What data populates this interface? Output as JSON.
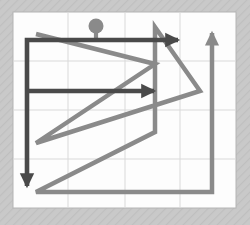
{
  "figure": {
    "title": "",
    "background_color": "#c8c8c8",
    "hatch_color": "#bdbdbd",
    "plot_background_color": "#fdfdfd",
    "plot_border_color": "#b4b4b4",
    "grid_color": "#d9d9d9"
  },
  "plot_area": {
    "x": 13,
    "y": 12,
    "width": 223,
    "height": 196
  },
  "grid": {
    "x_ticks": [
      13,
      68,
      125,
      180,
      236
    ],
    "y_ticks": [
      12,
      61,
      110,
      159,
      208
    ],
    "visible": true
  },
  "chart_data": {
    "type": "line",
    "title": "",
    "xlabel": "",
    "ylabel": "",
    "xlim": [
      13,
      236
    ],
    "ylim": [
      208,
      12
    ],
    "grid": true,
    "legend": "none",
    "series": [
      {
        "name": "dark-path",
        "color": "#4a4a4a",
        "linewidth": 4.5,
        "marker_start": "circle",
        "arrow_heads": [
          "segment-2-end",
          "segment-4-end",
          "segment-5-end"
        ],
        "points": [
          [
            96,
            27
          ],
          [
            96,
            40
          ],
          [
            184,
            40
          ],
          [
            27,
            40
          ],
          [
            27,
            91
          ],
          [
            160,
            91
          ],
          [
            27,
            91
          ],
          [
            27,
            192
          ]
        ]
      },
      {
        "name": "gray-path",
        "color": "#8a8a8a",
        "linewidth": 4.5,
        "arrow_heads": [
          "end"
        ],
        "points": [
          [
            36,
            34
          ],
          [
            155,
            64
          ],
          [
            36,
            143
          ],
          [
            200,
            91
          ],
          [
            155,
            27
          ],
          [
            155,
            132
          ],
          [
            36,
            192
          ],
          [
            212,
            192
          ],
          [
            212,
            27
          ]
        ]
      }
    ],
    "markers": [
      {
        "name": "path-origin-dot",
        "x": 96,
        "y": 27,
        "radius": 7,
        "color": "#8a8a8a"
      }
    ]
  },
  "axis_labels": {
    "x_tick_labels": [
      "",
      "",
      "",
      "",
      ""
    ],
    "y_tick_labels": [
      "",
      "",
      "",
      "",
      ""
    ]
  }
}
